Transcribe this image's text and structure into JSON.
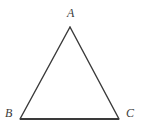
{
  "figure": {
    "name": "triangle-abc",
    "background_color": "#ffffff",
    "stroke_color": "#3a3a3a",
    "label_color": "#3a3a3a"
  },
  "labels": {
    "apex": "A",
    "bottom_left": "B",
    "bottom_right": "C"
  },
  "geometry": {
    "vertices": {
      "A": {
        "x": 70,
        "y": 27
      },
      "B": {
        "x": 20,
        "y": 119
      },
      "C": {
        "x": 119,
        "y": 119
      }
    },
    "sides": [
      {
        "name": "AB",
        "from": "A",
        "to": "B",
        "stroke_width": 1.4
      },
      {
        "name": "AC",
        "from": "A",
        "to": "C",
        "stroke_width": 1.4
      },
      {
        "name": "BC",
        "from": "B",
        "to": "C",
        "stroke_width": 2.2
      }
    ],
    "canvas": {
      "width": 144,
      "height": 135
    }
  }
}
